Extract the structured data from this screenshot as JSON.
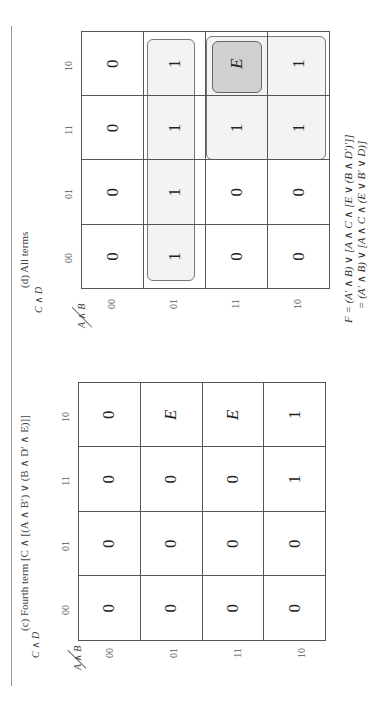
{
  "panels": [
    {
      "id": "c",
      "caption": "(c) Fourth term [C ∧ [(A ∧ B′) ∨ (B ∧ D′ ∧ E)]]",
      "col_var": "C ∧ D",
      "row_var": "A ∧ B",
      "col_headers": [
        "00",
        "01",
        "11",
        "10"
      ],
      "row_headers": [
        "00",
        "01",
        "11",
        "10"
      ],
      "cells": [
        [
          "0",
          "0",
          "0",
          "0"
        ],
        [
          "0",
          "0",
          "0",
          "E"
        ],
        [
          "0",
          "0",
          "0",
          "E"
        ],
        [
          "0",
          "0",
          "1",
          "1"
        ]
      ]
    },
    {
      "id": "d",
      "caption": "(d) All terms",
      "col_var": "C ∧ D",
      "row_var": "A ∧ B",
      "col_headers": [
        "00",
        "01",
        "11",
        "10"
      ],
      "row_headers": [
        "00",
        "01",
        "11",
        "10"
      ],
      "cells": [
        [
          "0",
          "0",
          "0",
          "0"
        ],
        [
          "1",
          "1",
          "1",
          "1"
        ],
        [
          "0",
          "0",
          "1",
          "E"
        ],
        [
          "0",
          "0",
          "1",
          "1"
        ]
      ],
      "groups": [
        {
          "name": "row-01-group",
          "rows": [
            1,
            1
          ],
          "cols": [
            0,
            3
          ],
          "shade": "light"
        },
        {
          "name": "rows-11-10-cols-11-10-group",
          "rows": [
            2,
            3
          ],
          "cols": [
            2,
            3
          ],
          "shade": "light"
        },
        {
          "name": "e-cell-group",
          "rows": [
            2,
            2
          ],
          "cols": [
            3,
            3
          ],
          "shade": "dark"
        }
      ],
      "formula": {
        "line1": "F = (A′ ∧ B) ∨ [A ∧ C ∧ [E ∨ (B ∧ D′)′]]",
        "line2": "= (A′ ∧ B) ∨ [A ∧ C ∧ (E ∨ B′ ∨ D)]"
      }
    }
  ],
  "colors": {
    "group_fill": "#ececec",
    "group_dark_fill": "#d0d0d0",
    "grid_line": "#555555"
  }
}
